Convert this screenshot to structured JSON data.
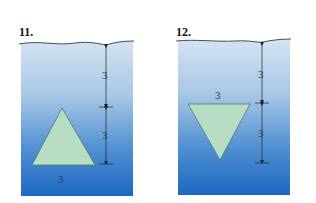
{
  "figures": [
    {
      "number": "11.",
      "shape": "triangle-apex-up",
      "depth_top_label": "3",
      "depth_height_label": "3",
      "base_label": "3"
    },
    {
      "number": "12.",
      "shape": "triangle-apex-down",
      "depth_top_label": "3",
      "depth_height_label": "3",
      "base_label": "3"
    }
  ],
  "colors": {
    "water_top": "#c9dcef",
    "water_bottom": "#1f6cc4",
    "plate": "#b7dcc4",
    "plate_edge": "#4f7f68",
    "line": "#222222"
  }
}
